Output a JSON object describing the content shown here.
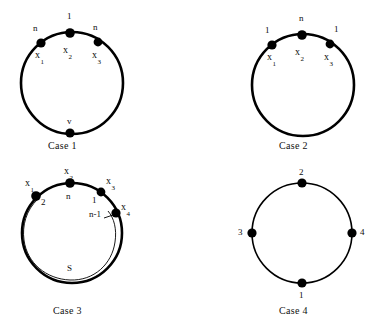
{
  "figure": {
    "background_color": "#ffffff",
    "ink_color": "#000000",
    "panels": [
      {
        "id": "case-1",
        "caption": "Case  1",
        "circle": {
          "cx": 72,
          "cy": 83,
          "r": 51,
          "stroke": "thick"
        },
        "nodes": [
          {
            "id": "x1",
            "label": "x",
            "sub": "1",
            "edge_label": "n",
            "cx": 41,
            "cy": 43
          },
          {
            "id": "x2",
            "label": "x",
            "sub": "2",
            "edge_label": "1",
            "cx": 70,
            "cy": 33
          },
          {
            "id": "x3",
            "label": "x",
            "sub": "3",
            "edge_label": "n",
            "cx": 98,
            "cy": 42
          },
          {
            "id": "v",
            "label": "v",
            "sub": "",
            "edge_label": "",
            "cx": 70,
            "cy": 133
          }
        ]
      },
      {
        "id": "case-2",
        "caption": "Case  2",
        "circle": {
          "cx": 303,
          "cy": 85,
          "r": 51,
          "stroke": "thick"
        },
        "nodes": [
          {
            "id": "x1",
            "label": "x",
            "sub": "1",
            "edge_label": "1",
            "cx": 272,
            "cy": 45
          },
          {
            "id": "x2",
            "label": "x",
            "sub": "2",
            "edge_label": "n",
            "cx": 302,
            "cy": 35
          },
          {
            "id": "x3",
            "label": "x",
            "sub": "3",
            "edge_label": "1",
            "cx": 330,
            "cy": 44
          }
        ]
      },
      {
        "id": "case-3",
        "caption": "Case 3",
        "circle": {
          "cx": 72,
          "cy": 233,
          "r": 50,
          "stroke": "thick"
        },
        "inner_arc_label": "S",
        "nodes": [
          {
            "id": "x1",
            "label": "x",
            "sub": "1",
            "edge_label": "2",
            "cx": 36,
            "cy": 196
          },
          {
            "id": "x2",
            "label": "x",
            "sub": "2",
            "edge_label": "n",
            "cx": 70,
            "cy": 183
          },
          {
            "id": "x3",
            "label": "x",
            "sub": "3",
            "edge_label": "1",
            "cx": 101,
            "cy": 192
          },
          {
            "id": "x4",
            "label": "x",
            "sub": "4",
            "edge_label": "n-1",
            "cx": 116,
            "cy": 213
          }
        ]
      },
      {
        "id": "case-4",
        "caption": "Case  4",
        "circle": {
          "cx": 302,
          "cy": 233,
          "r": 50,
          "stroke": "thin"
        },
        "nodes": [
          {
            "id": "top",
            "label": "2",
            "sub": "",
            "edge_label": "",
            "cx": 302,
            "cy": 183
          },
          {
            "id": "left",
            "label": "3",
            "sub": "",
            "edge_label": "",
            "cx": 252,
            "cy": 233
          },
          {
            "id": "right",
            "label": "4",
            "sub": "",
            "edge_label": "",
            "cx": 352,
            "cy": 233
          },
          {
            "id": "bottom",
            "label": "1",
            "sub": "",
            "edge_label": "",
            "cx": 302,
            "cy": 283
          }
        ]
      }
    ]
  },
  "labels": {
    "case1": {
      "edge_n_left": "n",
      "edge_1_top": "1",
      "edge_n_right": "n",
      "x1": "x",
      "x1_sub": "1",
      "x2": "x",
      "x2_sub": "2",
      "x3": "x",
      "x3_sub": "3",
      "v": "v",
      "caption": "Case  1"
    },
    "case2": {
      "edge_1_left": "1",
      "edge_n_top": "n",
      "edge_1_right": "1",
      "x1": "x",
      "x1_sub": "1",
      "x2": "x",
      "x2_sub": "2",
      "x3": "x",
      "x3_sub": "3",
      "caption": "Case  2"
    },
    "case3": {
      "x1": "x",
      "x1_sub": "1",
      "x2": "x",
      "x2_sub": "2",
      "x3": "x",
      "x3_sub": "3",
      "x4": "x",
      "x4_sub": "4",
      "edge_2": "2",
      "edge_n": "n",
      "edge_1": "1",
      "edge_nm1": "n-1",
      "inner_arc": "S",
      "caption": "Case 3"
    },
    "case4": {
      "top": "2",
      "left": "3",
      "right": "4",
      "bottom": "1",
      "caption": "Case  4"
    }
  }
}
